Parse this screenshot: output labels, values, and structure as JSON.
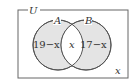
{
  "diagram": {
    "type": "venn",
    "universe_label": "U",
    "sets": [
      {
        "label": "A",
        "region_label": "19−x"
      },
      {
        "label": "B",
        "region_label": "17−x"
      }
    ],
    "intersection_label": "x",
    "outside_label": "x",
    "colors": {
      "fill": "#e4e4e4",
      "stroke": "#555555",
      "background": "#ffffff"
    }
  }
}
